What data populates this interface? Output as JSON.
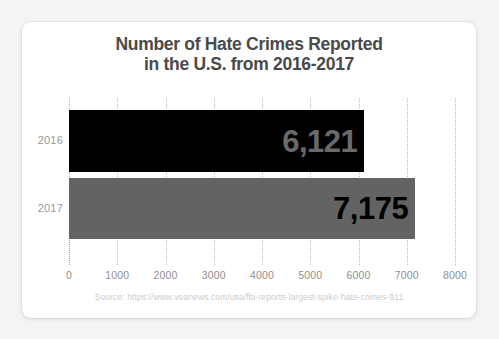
{
  "chart_data": {
    "type": "bar",
    "orientation": "horizontal",
    "title": "Number of Hate Crimes Reported in the U.S. from 2016-2017",
    "title_line1": "Number of Hate Crimes Reported",
    "title_line2": "in the U.S. from 2016-2017",
    "categories": [
      "2016",
      "2017"
    ],
    "values": [
      6121,
      7175
    ],
    "value_labels": [
      "6,121",
      "7,175"
    ],
    "xlabel": "",
    "ylabel": "",
    "xlim": [
      0,
      8000
    ],
    "xticks": [
      0,
      1000,
      2000,
      3000,
      4000,
      5000,
      6000,
      7000,
      8000
    ],
    "xtick_labels": [
      "0",
      "1000",
      "2000",
      "3000",
      "4000",
      "5000",
      "6000",
      "7000",
      "8000"
    ],
    "grid": true,
    "grid_style": "dotted-vertical",
    "legend": false,
    "series": [
      {
        "name": "2016",
        "value": 6121,
        "value_label": "6,121",
        "bar_color": "#000000",
        "label_color": "#6a6a6a"
      },
      {
        "name": "2017",
        "value": 7175,
        "value_label": "7,175",
        "bar_color": "#636363",
        "label_color": "#000000"
      }
    ]
  },
  "source": {
    "text": "Source: https://www.voanews.com/usa/fbi-reports-largest-spike-hate-crimes-911"
  },
  "colors": {
    "page_background": "#f4f4f4",
    "card_background": "#ffffff",
    "title_text": "#4a4a4a",
    "tick_text": "#8f8f8f",
    "category_text": "#9a9a9a",
    "gridline": "#b9b9b9",
    "source_text": "#cccccc"
  }
}
